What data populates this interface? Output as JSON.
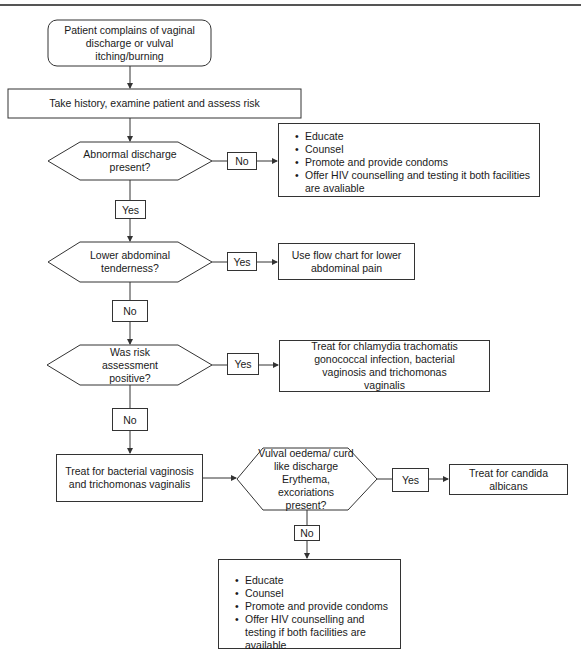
{
  "diagram": {
    "type": "flowchart",
    "nodes": {
      "start": "Patient complains of vaginal discharge or vulval itching/burning",
      "history": "Take history, examine patient and assess risk",
      "decision_discharge": "Abnormal discharge present?",
      "decision_tenderness": "Lower abdominal tenderness?",
      "decision_risk": "Was risk assessment positive?",
      "decision_vulval": "Vulval oedema/ curd like discharge Erythema, excoriations present?",
      "lower_abdominal": "Use flow chart for lower abdominal pain",
      "treat_chlamydia": "Treat for chlamydia trachomatis gonococcal infection, bacterial vaginosis and trichomonas vaginalis",
      "treat_bv": "Treat for bacterial vaginosis and trichomonas vaginalis",
      "treat_candida": "Treat for candida albicans"
    },
    "advice_top": [
      "Educate",
      "Counsel",
      "Promote and provide condoms",
      "Offer HIV counselling and testing it both facilities are avaliable"
    ],
    "advice_bottom": [
      "Educate",
      "Counsel",
      "Promote and provide condoms",
      "Offer HIV counselling and testing if both facilities are available"
    ],
    "edge_labels": {
      "discharge_no": "No",
      "discharge_yes": "Yes",
      "tenderness_yes": "Yes",
      "tenderness_no": "No",
      "risk_yes": "Yes",
      "risk_no": "No",
      "vulval_yes": "Yes",
      "vulval_no": "No"
    },
    "colors": {
      "stroke": "#333333",
      "text": "#1a1a1a",
      "background": "#ffffff"
    }
  }
}
